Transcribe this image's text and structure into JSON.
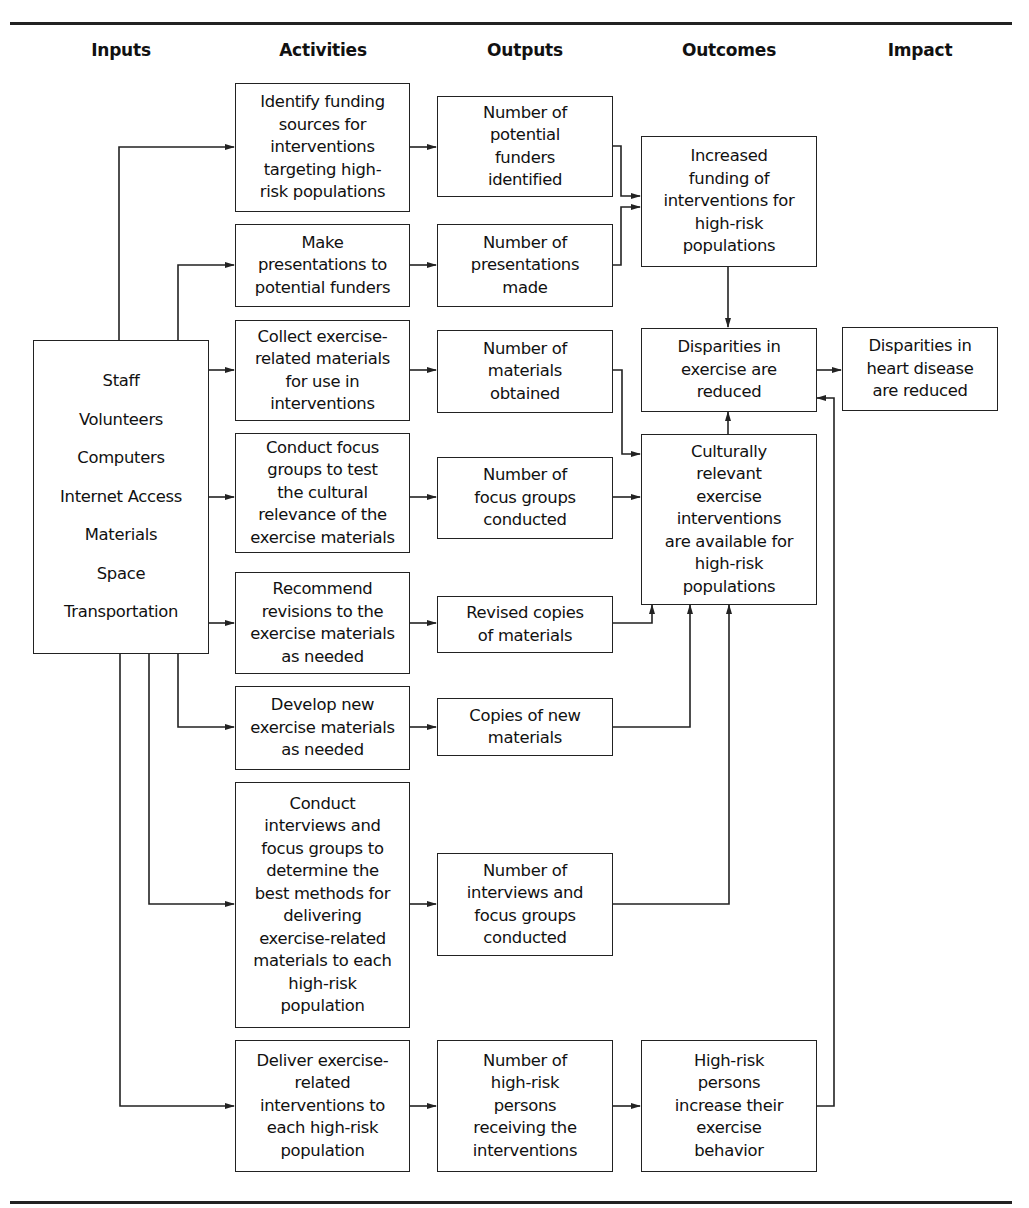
{
  "headers": {
    "inputs": "Inputs",
    "activities": "Activities",
    "outputs": "Outputs",
    "outcomes": "Outcomes",
    "impact": "Impact"
  },
  "inputs": {
    "items": [
      "Staff",
      "Volunteers",
      "Computers",
      "Internet Access",
      "Materials",
      "Space",
      "Transportation"
    ]
  },
  "activities": [
    "Identify funding\nsources for\ninterventions\ntargeting high-\nrisk populations",
    "Make\npresentations to\npotential funders",
    "Collect exercise-\nrelated materials\nfor use in\ninterventions",
    "Conduct focus\ngroups to test\nthe cultural\nrelevance of the\nexercise materials",
    "Recommend\nrevisions to the\nexercise materials\nas needed",
    "Develop new\nexercise materials\nas needed",
    "Conduct\ninterviews and\nfocus groups to\ndetermine the\nbest methods for\ndelivering\nexercise-related\nmaterials to each\nhigh-risk\npopulation",
    "Deliver exercise-\nrelated\ninterventions to\neach high-risk\npopulation"
  ],
  "outputs": [
    "Number of\npotential\nfunders\nidentified",
    "Number of\npresentations\nmade",
    "Number of\nmaterials\nobtained",
    "Number of\nfocus groups\nconducted",
    "Revised copies\nof materials",
    "Copies of new\nmaterials",
    "Number of\ninterviews and\nfocus groups\nconducted",
    "Number of\nhigh-risk\npersons\nreceiving the\ninterventions"
  ],
  "outcomes": [
    "Increased\nfunding of\ninterventions for\nhigh-risk\npopulations",
    "Disparities in\nexercise are\nreduced",
    "Culturally\nrelevant\nexercise\ninterventions\nare available for\nhigh-risk\npopulations",
    "High-risk\npersons\nincrease their\nexercise\nbehavior"
  ],
  "impact": [
    "Disparities in\nheart disease\nare reduced"
  ],
  "style": {
    "line_color": "#222222",
    "background": "#ffffff"
  }
}
